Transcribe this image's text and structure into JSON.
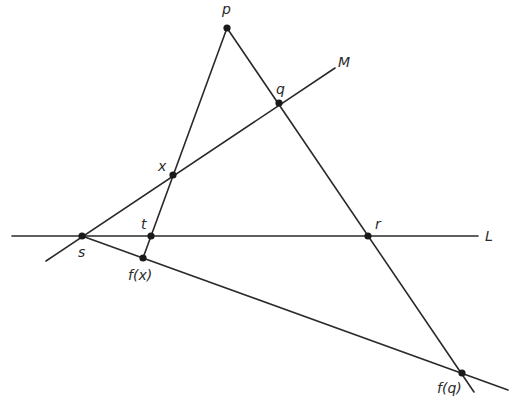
{
  "diagram": {
    "type": "projective-geometry-construction",
    "colors": {
      "line": "#2a2a2a",
      "point": "#1a1a1a",
      "background": "#ffffff"
    },
    "points": [
      {
        "id": "p",
        "label": "p",
        "x": 227,
        "y": 28,
        "lx": 222,
        "ly": 14
      },
      {
        "id": "q",
        "label": "q",
        "x": 279,
        "y": 103,
        "lx": 276,
        "ly": 94
      },
      {
        "id": "x",
        "label": "x",
        "x": 173,
        "y": 175,
        "lx": 158,
        "ly": 171
      },
      {
        "id": "t",
        "label": "t",
        "x": 151,
        "y": 236,
        "lx": 141,
        "ly": 229
      },
      {
        "id": "s",
        "label": "s",
        "x": 82,
        "y": 236,
        "lx": 78,
        "ly": 257
      },
      {
        "id": "r",
        "label": "r",
        "x": 368,
        "y": 236,
        "lx": 375,
        "ly": 229
      },
      {
        "id": "fx",
        "label": "f(x)",
        "x": 143,
        "y": 258,
        "lx": 128,
        "ly": 280
      },
      {
        "id": "fq",
        "label": "f(q)",
        "x": 462,
        "y": 373,
        "lx": 437,
        "ly": 393
      }
    ],
    "lines": [
      {
        "id": "L",
        "label": "L",
        "x1": 12,
        "y1": 236,
        "x2": 478,
        "y2": 236,
        "lx": 485,
        "ly": 241
      },
      {
        "id": "M",
        "label": "M",
        "x1": 46,
        "y1": 261,
        "x2": 335,
        "y2": 68,
        "lx": 338,
        "ly": 67
      },
      {
        "id": "p-fx",
        "label": "",
        "x1": 227,
        "y1": 28,
        "x2": 143,
        "y2": 258
      },
      {
        "id": "p-fq",
        "label": "",
        "x1": 227,
        "y1": 28,
        "x2": 474,
        "y2": 392
      },
      {
        "id": "s-fq",
        "label": "",
        "x1": 82,
        "y1": 236,
        "x2": 508,
        "y2": 390
      }
    ]
  }
}
